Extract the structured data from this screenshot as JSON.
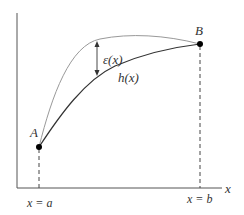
{
  "diagram": {
    "point_a": {
      "label": "A"
    },
    "point_b": {
      "label": "B"
    },
    "curve_h": {
      "label": "h(x)"
    },
    "error": {
      "label": "ε(x)"
    },
    "x_axis": {
      "label": "x"
    },
    "bound_a": {
      "label": "x = a"
    },
    "bound_b": {
      "label": "x = b"
    },
    "colors": {
      "axis": "#555555",
      "curve_h": "#333333",
      "curve_upper": "#999999",
      "points": "#000000"
    }
  }
}
